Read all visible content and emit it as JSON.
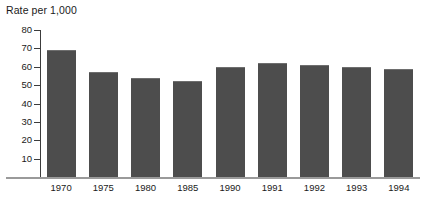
{
  "chart_data": {
    "type": "bar",
    "title": "Rate per 1,000",
    "xlabel": "",
    "ylabel": "",
    "categories": [
      "1970",
      "1975",
      "1980",
      "1985",
      "1990",
      "1991",
      "1992",
      "1993",
      "1994"
    ],
    "values": [
      69,
      57,
      54,
      52,
      60,
      62,
      61,
      60,
      59
    ],
    "ylim": [
      0,
      80
    ],
    "ytick_labels": [
      "80",
      "70",
      "60",
      "50",
      "40",
      "30",
      "20",
      "10"
    ],
    "yticks": [
      80,
      70,
      60,
      50,
      40,
      30,
      20,
      10
    ],
    "grid": false,
    "legend": null,
    "series": [
      {
        "name": "Rate per 1,000",
        "values": [
          69,
          57,
          54,
          52,
          60,
          62,
          61,
          60,
          59
        ]
      }
    ],
    "colors": {
      "bar_fill": "#4d4d4d",
      "bar_top_edge": "#6e6e6e",
      "axis": "#3c3c3c",
      "baseline": "#9a9a9a",
      "text": "#1a1a1a",
      "background": "#ffffff"
    }
  }
}
